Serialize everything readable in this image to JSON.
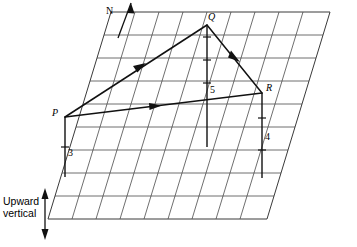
{
  "figure": {
    "background_color": "#ffffff",
    "line_color": "#111111",
    "grid_color": "#4a4a4a"
  },
  "labels": {
    "north": "N",
    "vertex_p": "P",
    "vertex_q": "Q",
    "vertex_r": "R",
    "height_p": "3",
    "height_q": "5",
    "height_r": "4",
    "upward_line1": "Upward",
    "upward_line2": "vertical"
  },
  "icons": {
    "north_arrow": "north-arrow-icon",
    "upward_vertical_arrow": "double-headed-vertical-arrow-icon",
    "pq_direction_arrow": "arrowhead-icon",
    "qr_direction_arrow": "arrowhead-icon",
    "pr_direction_arrow": "arrowhead-icon"
  },
  "geometry": {
    "grid": {
      "columns": 9,
      "rows": 9,
      "plane_type": "parallelogram-perspective-grid"
    },
    "vertices": {
      "P": {
        "x": 65,
        "y": 117
      },
      "Q": {
        "x": 207,
        "y": 25
      },
      "R": {
        "x": 262,
        "y": 93
      }
    },
    "foot_points": {
      "P_foot": {
        "x": 52,
        "y": 177
      },
      "Q_foot": {
        "x": 207,
        "y": 147
      },
      "R_foot": {
        "x": 262,
        "y": 178
      }
    },
    "heights": {
      "P": 3,
      "Q": 5,
      "R": 4
    },
    "edges": [
      {
        "from": "P",
        "to": "Q",
        "has_arrow": true
      },
      {
        "from": "Q",
        "to": "R",
        "has_arrow": true
      },
      {
        "from": "P",
        "to": "R",
        "has_arrow": true
      }
    ]
  }
}
